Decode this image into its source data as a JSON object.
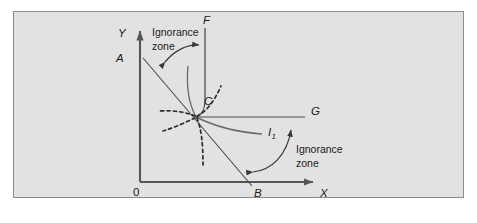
{
  "figure": {
    "type": "economics-indifference-diagram",
    "background_color": "#e2e2e2",
    "page_color": "#ffffff",
    "border_color": "#8c8c8c",
    "line_color": "#4a4a4a",
    "axis_color": "#555555",
    "text_color": "#1a1a1a"
  },
  "axes": {
    "y_label": "Y",
    "x_label": "X",
    "origin_label": "0"
  },
  "points": {
    "a_label": "A",
    "b_label": "B",
    "c_label": "C",
    "f_label": "F",
    "g_label": "G"
  },
  "curves": {
    "indifference_label": "I",
    "indifference_subscript": "1"
  },
  "annotations": [
    {
      "line1": "Ignorance",
      "line2": "zone"
    },
    {
      "line1": "Ignorance",
      "line2": "zone"
    }
  ],
  "icons": {
    "y_axis_arrow": "arrow-up-icon",
    "x_axis_arrow": "arrow-right-icon",
    "zone_arrow_top": "double-headed-curved-arrow-icon",
    "zone_arrow_bottom": "double-headed-curved-arrow-icon"
  }
}
